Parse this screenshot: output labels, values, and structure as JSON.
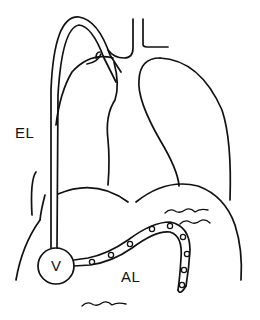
{
  "figure": {
    "caption_fragment": "",
    "labels": {
      "external_limb": "EL",
      "valve": "V",
      "abdominal_limb": "AL"
    },
    "line_color": "#111111",
    "background": "#ffffff"
  }
}
